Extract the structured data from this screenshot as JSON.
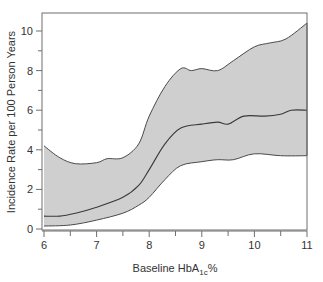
{
  "chart_data": {
    "type": "area",
    "title": "",
    "xlabel": "Baseline HbA1c %",
    "xlabel_parts": {
      "main": "Baseline HbA",
      "sub": "1c",
      "suffix": "%"
    },
    "ylabel": "Incidence Rate per 100 Person Years",
    "xlim": [
      6,
      11
    ],
    "ylim": [
      0,
      10.7
    ],
    "x_ticks": [
      6,
      7,
      8,
      9,
      10,
      11
    ],
    "x_minor_ticks": [
      6.5,
      7.5,
      8.5,
      9.5,
      10.5
    ],
    "y_ticks": [
      0,
      2,
      4,
      6,
      8,
      10
    ],
    "y_minor_ticks": [
      1,
      3,
      5,
      7,
      9
    ],
    "grid": false,
    "legend": null,
    "colors": {
      "band_fill": "#cfcfcf",
      "line": "#4a4a4a",
      "frame": "#6e6e6e"
    },
    "series": [
      {
        "name": "Upper confidence bound",
        "x": [
          6.0,
          6.3,
          6.6,
          7.0,
          7.2,
          7.5,
          7.8,
          8.0,
          8.3,
          8.6,
          8.8,
          9.0,
          9.3,
          9.6,
          10.0,
          10.3,
          10.6,
          11.0
        ],
        "values": [
          4.2,
          3.6,
          3.3,
          3.35,
          3.55,
          3.6,
          4.3,
          5.7,
          7.2,
          8.1,
          8.0,
          8.1,
          8.0,
          8.5,
          9.2,
          9.4,
          9.6,
          10.4
        ]
      },
      {
        "name": "Incidence rate (estimate)",
        "x": [
          6.0,
          6.3,
          6.6,
          7.0,
          7.5,
          7.8,
          8.0,
          8.3,
          8.6,
          9.0,
          9.3,
          9.5,
          9.8,
          10.2,
          10.5,
          10.7,
          11.0
        ],
        "values": [
          0.65,
          0.65,
          0.8,
          1.1,
          1.6,
          2.2,
          3.0,
          4.3,
          5.1,
          5.3,
          5.4,
          5.3,
          5.7,
          5.7,
          5.8,
          6.0,
          6.0
        ]
      },
      {
        "name": "Lower confidence bound",
        "x": [
          6.0,
          6.5,
          7.0,
          7.5,
          7.8,
          8.0,
          8.3,
          8.6,
          9.0,
          9.3,
          9.6,
          10.0,
          10.5,
          11.0
        ],
        "values": [
          0.15,
          0.2,
          0.45,
          0.8,
          1.2,
          1.6,
          2.5,
          3.2,
          3.4,
          3.5,
          3.5,
          3.8,
          3.7,
          3.7
        ]
      }
    ]
  }
}
